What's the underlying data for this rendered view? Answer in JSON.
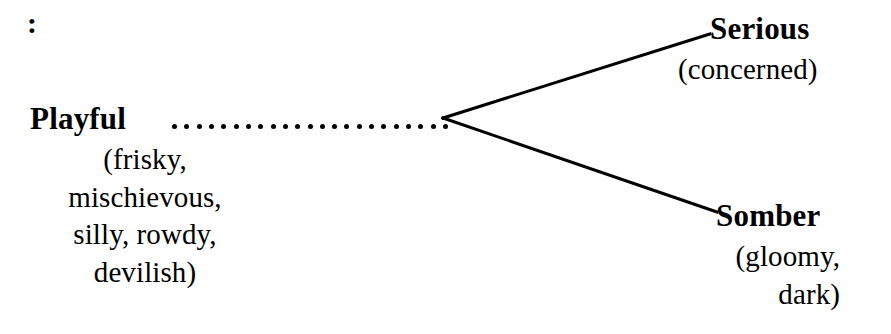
{
  "diagram": {
    "type": "branching-tree",
    "orientation": "left-to-right",
    "stray_marker": ":",
    "connector_style": "dot-leader",
    "branch_count": 2,
    "colors": {
      "ink": "#000000",
      "background": "#ffffff"
    },
    "root": {
      "label": "Playful",
      "synonym_lines": [
        "(frisky,",
        "mischievous,",
        "silly, rowdy,",
        "devilish)"
      ],
      "synonyms_text": "(frisky, mischievous, silly, rowdy, devilish)"
    },
    "branches": [
      {
        "id": "serious",
        "label": "Serious",
        "synonym_lines": [
          "(concerned)"
        ],
        "synonyms_text": "(concerned)",
        "position": "upper"
      },
      {
        "id": "somber",
        "label": "Somber",
        "synonym_lines": [
          "(gloomy,",
          "dark)"
        ],
        "synonyms_text": "(gloomy, dark)",
        "position": "lower"
      }
    ],
    "leader_dot_count": 23,
    "geometry": {
      "vertex_x": 443,
      "vertex_y": 118,
      "upper_end_x": 710,
      "upper_end_y": 34,
      "lower_end_x": 717,
      "lower_end_y": 212,
      "stroke_width": 3
    }
  }
}
